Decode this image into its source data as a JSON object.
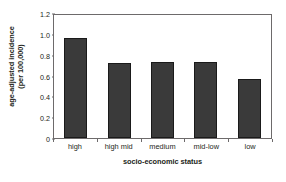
{
  "chart_data": {
    "type": "bar",
    "title": "",
    "categories": [
      "high",
      "high mid",
      "medium",
      "mid-low",
      "low"
    ],
    "values": [
      0.96,
      0.72,
      0.73,
      0.73,
      0.57
    ],
    "xlabel": "socio-economic status",
    "ylabel_lines": [
      "age-adjusted incidence",
      "(per 100,000)"
    ],
    "ylabel": "age-adjusted incidence (per 100,000)",
    "ylim": [
      0,
      1.2
    ],
    "yticks": [
      0,
      0.2,
      0.4,
      0.6,
      0.8,
      1.0,
      1.2
    ],
    "ytick_labels": [
      "0",
      "0.2",
      "0.4",
      "0.6",
      "0.8",
      "1.0",
      "1.2"
    ],
    "grid": false,
    "legend": false,
    "bar_color": "#3a3a3a",
    "bar_edge_color": "#1a1a1a",
    "axis_color": "#6d6a6b",
    "background_color": "#ffffff"
  }
}
